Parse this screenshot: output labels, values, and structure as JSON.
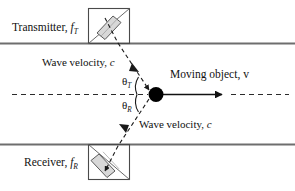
{
  "figure": {
    "width": 295,
    "height": 191,
    "background": "#ffffff",
    "colors": {
      "pipe_wall": "#6e6e6e",
      "beam": "#1a1a1a",
      "centerline": "#2b2b2b",
      "object": "#000000",
      "transducer_outline": "#4a4a4a",
      "crystal_fill": "#d8d8d8",
      "text": "#111111"
    }
  },
  "labels": {
    "transmitter": "Transmitter,",
    "transmitter_symbol": "f",
    "transmitter_subscript": "T",
    "receiver": "Receiver,",
    "receiver_symbol": "f",
    "receiver_subscript": "R",
    "wave_velocity_top": "Wave velocity,",
    "wave_velocity_top_symbol": "c",
    "wave_velocity_bottom": "Wave velocity,",
    "wave_velocity_bottom_symbol": "c",
    "moving_object": "Moving object, v",
    "theta_transmit_symbol": "θ",
    "theta_transmit_subscript": "T",
    "theta_receive_symbol": "θ",
    "theta_receive_subscript": "R"
  },
  "geometry": {
    "pipe_wall_top_y": 43,
    "pipe_wall_bottom_y": 144,
    "centerline_y": 94,
    "object_x": 156,
    "object_y": 94,
    "object_radius": 7,
    "transmitter_box": {
      "x": 88,
      "y": 8,
      "w": 42,
      "h": 35
    },
    "receiver_box": {
      "x": 88,
      "y": 144,
      "w": 42,
      "h": 35
    },
    "velocity_arrow_end_x": 225,
    "centerline_right_end_x": 288,
    "centerline_left_end_x": 12
  }
}
